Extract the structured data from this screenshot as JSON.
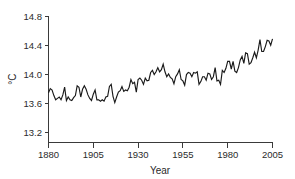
{
  "chart_data": {
    "type": "line",
    "title": "",
    "subtitle": "",
    "xlabel": "Year",
    "ylabel": "°C",
    "xlim": [
      1880,
      2005
    ],
    "ylim": [
      13.05,
      14.85
    ],
    "xticks": [
      1880,
      1905,
      1930,
      1955,
      1980,
      2005
    ],
    "xtick_labels": [
      "1880",
      "1905",
      "1930",
      "1955",
      "1980",
      "2005"
    ],
    "yticks": [
      13.2,
      13.6,
      14.0,
      14.4,
      14.8
    ],
    "ytick_labels": [
      "13.2",
      "13.6",
      "14.0",
      "14.4",
      "14.8"
    ],
    "grid": false,
    "legend": false,
    "legend_position": "none",
    "line_color": "#1a1a1a",
    "axis_color": "#3a3a3a",
    "series": [
      {
        "name": "Global mean surface temperature",
        "units": "°C",
        "x": [
          1880,
          1881,
          1882,
          1883,
          1884,
          1885,
          1886,
          1887,
          1888,
          1889,
          1890,
          1891,
          1892,
          1893,
          1894,
          1895,
          1896,
          1897,
          1898,
          1899,
          1900,
          1901,
          1902,
          1903,
          1904,
          1905,
          1906,
          1907,
          1908,
          1909,
          1910,
          1911,
          1912,
          1913,
          1914,
          1915,
          1916,
          1917,
          1918,
          1919,
          1920,
          1921,
          1922,
          1923,
          1924,
          1925,
          1926,
          1927,
          1928,
          1929,
          1930,
          1931,
          1932,
          1933,
          1934,
          1935,
          1936,
          1937,
          1938,
          1939,
          1940,
          1941,
          1942,
          1943,
          1944,
          1945,
          1946,
          1947,
          1948,
          1949,
          1950,
          1951,
          1952,
          1953,
          1954,
          1955,
          1956,
          1957,
          1958,
          1959,
          1960,
          1961,
          1962,
          1963,
          1964,
          1965,
          1966,
          1967,
          1968,
          1969,
          1970,
          1971,
          1972,
          1973,
          1974,
          1975,
          1976,
          1977,
          1978,
          1979,
          1980,
          1981,
          1982,
          1983,
          1984,
          1985,
          1986,
          1987,
          1988,
          1989,
          1990,
          1991,
          1992,
          1993,
          1994,
          1995,
          1996,
          1997,
          1998,
          1999,
          2000,
          2001,
          2002,
          2003,
          2004,
          2005
        ],
        "values": [
          13.76,
          13.82,
          13.8,
          13.72,
          13.66,
          13.68,
          13.7,
          13.66,
          13.73,
          13.84,
          13.65,
          13.7,
          13.66,
          13.65,
          13.69,
          13.72,
          13.86,
          13.84,
          13.7,
          13.81,
          13.86,
          13.81,
          13.73,
          13.68,
          13.65,
          13.74,
          13.8,
          13.66,
          13.66,
          13.64,
          13.66,
          13.64,
          13.7,
          13.71,
          13.85,
          13.88,
          13.71,
          13.62,
          13.7,
          13.77,
          13.79,
          13.85,
          13.78,
          13.8,
          13.79,
          13.84,
          13.95,
          13.89,
          13.91,
          13.77,
          13.95,
          13.97,
          13.94,
          13.88,
          13.97,
          13.93,
          13.94,
          14.05,
          14.08,
          14.02,
          14.06,
          14.12,
          14.06,
          14.09,
          14.17,
          14.06,
          13.99,
          14.03,
          13.98,
          13.96,
          13.89,
          13.99,
          14.03,
          14.09,
          13.95,
          13.93,
          13.87,
          14.02,
          14.05,
          14.04,
          13.99,
          14.05,
          14.04,
          14.06,
          13.88,
          13.92,
          13.99,
          13.99,
          13.94,
          14.04,
          14.03,
          13.95,
          13.99,
          14.12,
          13.93,
          13.94,
          13.88,
          14.08,
          14.05,
          14.11,
          14.21,
          14.21,
          14.1,
          14.21,
          14.07,
          14.05,
          14.12,
          14.23,
          14.28,
          14.18,
          14.33,
          14.32,
          14.17,
          14.19,
          14.26,
          14.34,
          14.26,
          14.37,
          14.52,
          14.35,
          14.35,
          14.42,
          14.51,
          14.5,
          14.44,
          14.53
        ]
      }
    ]
  },
  "figure": {
    "y_axis_title": "°C",
    "x_axis_title": "Year"
  }
}
